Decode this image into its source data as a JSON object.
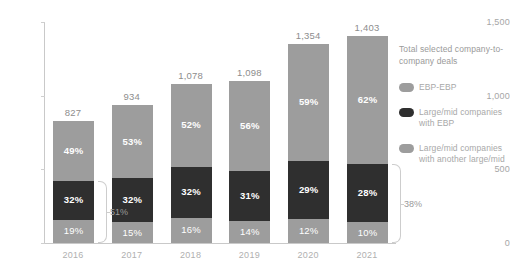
{
  "chart_data": {
    "type": "bar",
    "subtype": "stacked-bar-100-with-totals",
    "title": "",
    "xlabel": "",
    "ylabel": "",
    "ylim": [
      0,
      1500
    ],
    "yticks": [
      "0",
      "500",
      "1,000",
      "1,500"
    ],
    "ytick_values": [
      0,
      500,
      1000,
      1500
    ],
    "grid": false,
    "legend_position": "right",
    "categories": [
      "2016",
      "2017",
      "2018",
      "2019",
      "2020",
      "2021"
    ],
    "totals": [
      827,
      934,
      1078,
      1098,
      1354,
      1403
    ],
    "total_labels": [
      "827",
      "934",
      "1,078",
      "1,098",
      "1,354",
      "1,403"
    ],
    "series": [
      {
        "name": "EBP-EBP",
        "values": [
          49,
          53,
          52,
          56,
          59,
          62
        ],
        "labels": [
          "49%",
          "53%",
          "52%",
          "56%",
          "59%",
          "62%"
        ],
        "color": "#9d9d9d",
        "stack_position": "top"
      },
      {
        "name": "Large/mid companies with EBP",
        "values": [
          32,
          32,
          32,
          31,
          29,
          28
        ],
        "labels": [
          "32%",
          "32%",
          "32%",
          "31%",
          "29%",
          "28%"
        ],
        "color": "#2f2f2f",
        "stack_position": "middle"
      },
      {
        "name": "Large/mid companies with another large/mid",
        "values": [
          19,
          15,
          16,
          14,
          12,
          10
        ],
        "labels": [
          "19%",
          "15%",
          "16%",
          "14%",
          "12%",
          "10%"
        ],
        "color": "#9d9d9d",
        "stack_position": "bottom"
      }
    ],
    "annotations": [
      {
        "label": "51%",
        "category": "2016",
        "covers": [
          "Large/mid companies with EBP",
          "Large/mid companies with another large/mid"
        ],
        "side": "right"
      },
      {
        "label": "38%",
        "category": "2021",
        "covers": [
          "Large/mid companies with EBP",
          "Large/mid companies with another large/mid"
        ],
        "side": "right"
      }
    ]
  },
  "legend": {
    "title": "Total selected company-to-company deals",
    "items": [
      {
        "label": "EBP-EBP",
        "color": "#9d9d9d"
      },
      {
        "label": "Large/mid companies with EBP",
        "color": "#2f2f2f"
      },
      {
        "label": "Large/mid companies with another large/mid",
        "color": "#9d9d9d"
      }
    ]
  },
  "axis": {
    "y_ticks": [
      "1,500",
      "1,000",
      "500",
      "0"
    ]
  },
  "colors": {
    "ebp_ebp": "#9d9d9d",
    "large_mid_with_ebp": "#2f2f2f",
    "large_mid_with_large_mid": "#9d9d9d",
    "axis": "#c9c9c9",
    "tick_text": "#a6a6a6",
    "total_text": "#8d8d8d",
    "background": "#ffffff"
  }
}
